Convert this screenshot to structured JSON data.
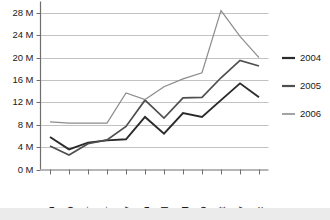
{
  "chart_data": {
    "type": "line",
    "title": "",
    "subtitle": "",
    "xlabel": "",
    "ylabel": "",
    "categories": [
      "Jan",
      "Feb",
      "Mar",
      "Apr",
      "May",
      "Jun",
      "Jul",
      "Aug",
      "Sep",
      "Oct",
      "Nov",
      "Dec"
    ],
    "series": [
      {
        "name": "2004",
        "color": "#2b2b2b",
        "values": [
          5.8,
          3.6,
          4.8,
          5.2,
          5.4,
          9.4,
          6.4,
          10.1,
          9.4,
          12.4,
          15.4,
          12.9
        ]
      },
      {
        "name": "2005",
        "color": "#4f4f4f",
        "values": [
          4.2,
          2.6,
          4.6,
          5.3,
          7.7,
          12.4,
          9.2,
          12.8,
          12.9,
          16.4,
          19.5,
          18.5
        ]
      },
      {
        "name": "2006",
        "color": "#8c8c8c",
        "values": [
          8.5,
          8.3,
          8.3,
          8.3,
          13.7,
          12.5,
          14.8,
          16.2,
          17.3,
          28.4,
          23.8,
          20.0
        ]
      }
    ],
    "ytick_labels": [
      "0 M",
      "4 M",
      "8 M",
      "12 M",
      "16 M",
      "20 M",
      "24 M",
      "28 M"
    ],
    "ytick_values": [
      0,
      4,
      8,
      12,
      16,
      20,
      24,
      28
    ],
    "ylim": [
      0,
      29.5
    ],
    "grid": true,
    "grid_axis": "y",
    "legend_position": "right",
    "value_suffix": " M",
    "value_scale": "millions"
  },
  "legend": {
    "entries": [
      {
        "label": "2004",
        "color": "#2b2b2b"
      },
      {
        "label": "2005",
        "color": "#4f4f4f"
      },
      {
        "label": "2006",
        "color": "#8c8c8c"
      }
    ]
  },
  "axes": {
    "y": {
      "labels": [
        "28 M",
        "24 M",
        "20 M",
        "16 M",
        "12 M",
        "8 M",
        "4 M",
        "0 M"
      ]
    },
    "x": {
      "labels": [
        "Jan",
        "Feb",
        "Mar",
        "Apr",
        "May",
        "Jun",
        "Jul",
        "Aug",
        "Sep",
        "Oct",
        "Nov",
        "Dec"
      ]
    }
  }
}
